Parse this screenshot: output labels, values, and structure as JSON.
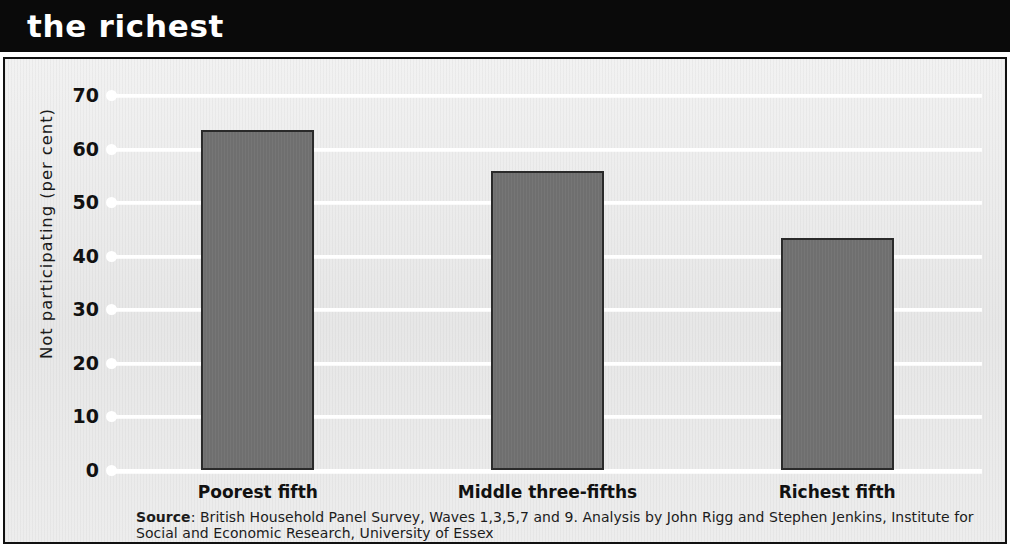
{
  "banner": {
    "title": "the richest"
  },
  "chart_data": {
    "type": "bar",
    "title": "the richest",
    "categories": [
      "Poorest fifth",
      "Middle three-fifths",
      "Richest fifth"
    ],
    "values": [
      63.5,
      55.8,
      43.3
    ],
    "xlabel": "",
    "ylabel": "Not participating (per cent)",
    "ylim": [
      0,
      70
    ],
    "ytick_labels": [
      "0",
      "10",
      "20",
      "30",
      "40",
      "50",
      "60",
      "70"
    ],
    "ytick_values": [
      0,
      10,
      20,
      30,
      40,
      50,
      60,
      70
    ],
    "grid": true,
    "legend": false,
    "bar_color": "#717171",
    "bar_border_color": "#2a2a2a",
    "plot_background": "#ebebeb",
    "gridline_color": "#ffffff",
    "source_label": "Source",
    "source_text": ": British Household Panel Survey, Waves 1,3,5,7 and 9. Analysis by John Rigg and Stephen Jenkins, Institute for Social and Economic Research, University of Essex"
  }
}
